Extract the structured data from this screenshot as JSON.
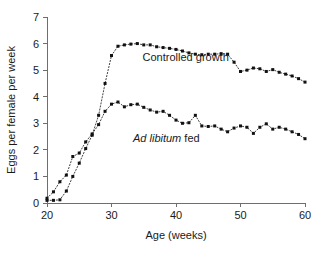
{
  "chart_data": {
    "type": "scatter",
    "title": "",
    "xlabel": "Age (weeks)",
    "ylabel": "Eggs per female per week",
    "xlim": [
      20,
      60
    ],
    "ylim": [
      0,
      7
    ],
    "xticks": [
      20,
      30,
      40,
      50,
      60
    ],
    "yticks": [
      0,
      1,
      2,
      3,
      4,
      5,
      6,
      7
    ],
    "xtick_labels": [
      "20",
      "30",
      "40",
      "50",
      "60"
    ],
    "ytick_labels": [
      "0",
      "1",
      "2",
      "3",
      "4",
      "5",
      "6",
      "7"
    ],
    "grid": false,
    "legend": "inline-annotations",
    "marker": "filled-square",
    "line_style": "dotted",
    "series": [
      {
        "name": "Controlled growth",
        "label_italic_prefix": "",
        "label_plain": "Controlled growth",
        "annotation_x": 41.5,
        "annotation_y": 5.35,
        "x": [
          20,
          21,
          22,
          23,
          24,
          25,
          26,
          27,
          28,
          29,
          30,
          31,
          32,
          33,
          34,
          35,
          36,
          37,
          38,
          39,
          40,
          41,
          42,
          43,
          44,
          45,
          46,
          47,
          48,
          49,
          50,
          51,
          52,
          53,
          54,
          55,
          56,
          57,
          58,
          59,
          60
        ],
        "y": [
          0.1,
          0.1,
          0.12,
          0.45,
          1.0,
          1.5,
          2.05,
          2.55,
          3.3,
          4.5,
          5.55,
          5.9,
          5.95,
          5.98,
          6.0,
          5.95,
          5.95,
          5.88,
          5.85,
          5.82,
          5.78,
          5.72,
          5.65,
          5.6,
          5.58,
          5.6,
          5.6,
          5.62,
          5.6,
          5.3,
          4.95,
          5.0,
          5.08,
          5.05,
          4.95,
          5.02,
          4.92,
          4.85,
          4.78,
          4.68,
          4.55
        ]
      },
      {
        "name": "Ad libitum fed",
        "label_italic_prefix": "Ad libitum",
        "label_plain": " fed",
        "annotation_x": 38.5,
        "annotation_y": 2.28,
        "x": [
          20,
          21,
          22,
          23,
          24,
          25,
          26,
          27,
          28,
          29,
          30,
          31,
          32,
          33,
          34,
          35,
          36,
          37,
          38,
          39,
          40,
          41,
          42,
          43,
          44,
          45,
          46,
          47,
          48,
          49,
          50,
          51,
          52,
          53,
          54,
          55,
          56,
          57,
          58,
          59,
          60
        ],
        "y": [
          0.18,
          0.42,
          0.8,
          1.05,
          1.75,
          1.88,
          2.3,
          2.6,
          2.95,
          3.45,
          3.72,
          3.8,
          3.62,
          3.7,
          3.72,
          3.6,
          3.5,
          3.42,
          3.45,
          3.3,
          3.12,
          3.0,
          3.02,
          3.3,
          2.9,
          2.88,
          2.9,
          2.78,
          2.68,
          2.82,
          2.9,
          2.85,
          2.62,
          2.85,
          2.98,
          2.78,
          2.85,
          2.78,
          2.68,
          2.58,
          2.42
        ]
      }
    ]
  }
}
